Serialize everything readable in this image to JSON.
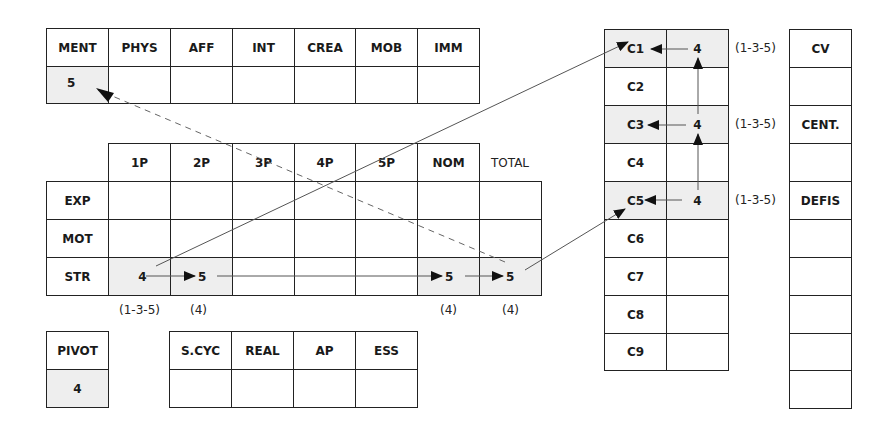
{
  "top_table": {
    "headers": [
      "MENT",
      "PHYS",
      "AFF",
      "INT",
      "CREA",
      "MOB",
      "IMM"
    ],
    "values": [
      "5",
      "",
      "",
      "",
      "",
      "",
      ""
    ]
  },
  "main_table": {
    "headers": [
      "1P",
      "2P",
      "3P",
      "4P",
      "5P",
      "NOM"
    ],
    "total_label": "TOTAL",
    "rows": [
      {
        "label": "EXP",
        "cells": [
          "",
          "",
          "",
          "",
          "",
          "",
          ""
        ]
      },
      {
        "label": "MOT",
        "cells": [
          "",
          "",
          "",
          "",
          "",
          "",
          ""
        ]
      },
      {
        "label": "STR",
        "cells": [
          "4",
          "5",
          "",
          "",
          "",
          "5",
          "5"
        ]
      }
    ],
    "footnotes": [
      "(1-3-5)",
      "(4)",
      "",
      "",
      "",
      "(4)",
      "(4)"
    ]
  },
  "pivot": {
    "label": "PIVOT",
    "value": "4"
  },
  "cycle_table": {
    "headers": [
      "S.CYC",
      "REAL",
      "AP",
      "ESS"
    ],
    "values": [
      "",
      "",
      "",
      ""
    ]
  },
  "c_table": {
    "rows": [
      {
        "label": "C1",
        "value": "4",
        "note": "(1-3-5)"
      },
      {
        "label": "C2",
        "value": "",
        "note": ""
      },
      {
        "label": "C3",
        "value": "4",
        "note": "(1-3-5)"
      },
      {
        "label": "C4",
        "value": "",
        "note": ""
      },
      {
        "label": "C5",
        "value": "4",
        "note": "(1-3-5)"
      },
      {
        "label": "C6",
        "value": "",
        "note": ""
      },
      {
        "label": "C7",
        "value": "",
        "note": ""
      },
      {
        "label": "C8",
        "value": "",
        "note": ""
      },
      {
        "label": "C9",
        "value": "",
        "note": ""
      }
    ]
  },
  "cv_column": [
    "CV",
    "",
    "CENT.",
    "",
    "DEFIS",
    "",
    "",
    "",
    "",
    ""
  ],
  "colors": {
    "highlight_fill": "#eeeeee",
    "line": "#222222"
  }
}
